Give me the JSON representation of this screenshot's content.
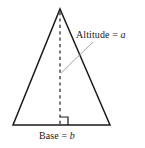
{
  "figure": {
    "labels": {
      "altitude": {
        "prefix": "Altitude = ",
        "variable": "a"
      },
      "base": {
        "prefix": "Base = ",
        "variable": "b"
      }
    },
    "colors": {
      "stroke": "#1a1a1a",
      "dashed": "#555555",
      "leader": "#9a9a9a",
      "background": "#ffffff",
      "text": "#1a1a1a"
    },
    "geometry": {
      "apex": [
        60,
        9
      ],
      "bottom_left": [
        13,
        125
      ],
      "bottom_right": [
        110,
        125
      ],
      "altitude_foot": [
        60,
        125
      ],
      "leader_start": [
        93,
        42
      ],
      "leader_end": [
        61,
        73
      ],
      "right_angle_size": 8
    }
  }
}
